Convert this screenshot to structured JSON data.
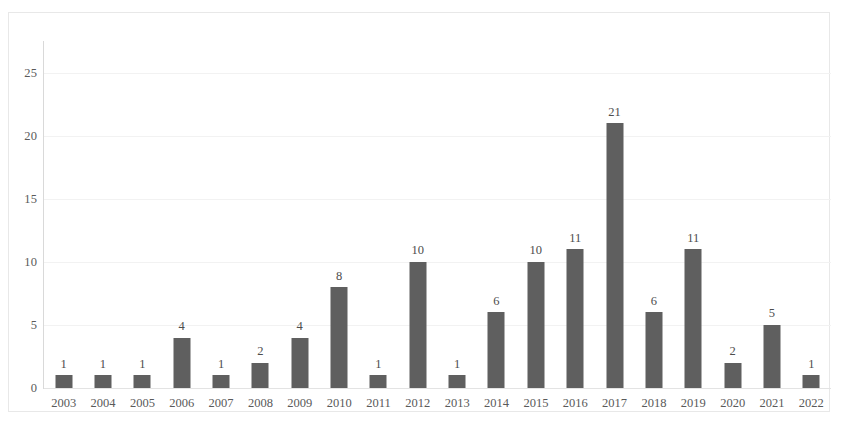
{
  "chart_data": {
    "type": "bar",
    "title": "",
    "subtitle": "",
    "xlabel": "",
    "ylabel": "",
    "categories": [
      "2003",
      "2004",
      "2005",
      "2006",
      "2007",
      "2008",
      "2009",
      "2010",
      "2011",
      "2012",
      "2013",
      "2014",
      "2015",
      "2016",
      "2017",
      "2018",
      "2019",
      "2020",
      "2021",
      "2022"
    ],
    "values": [
      1,
      1,
      1,
      4,
      1,
      2,
      4,
      8,
      1,
      10,
      1,
      6,
      10,
      11,
      21,
      6,
      11,
      2,
      5,
      1
    ],
    "data_labels": [
      "1",
      "1",
      "1",
      "4",
      "1",
      "2",
      "4",
      "8",
      "1",
      "10",
      "1",
      "6",
      "10",
      "11",
      "21",
      "6",
      "11",
      "2",
      "5",
      "1"
    ],
    "ylim": [
      0,
      27.5
    ],
    "y_ticks": [
      0,
      5,
      10,
      15,
      20,
      25
    ],
    "y_tick_labels": [
      "0",
      "5",
      "10",
      "15",
      "20",
      "25"
    ],
    "grid": true,
    "grid_axis": "y",
    "legend": false,
    "legend_position": "none",
    "bar_color": "#5f5f5f",
    "gridline_color": "#f2f2f2",
    "axis_color": "#d9d9d9",
    "label_color": "#5a5a5a",
    "border_color": "#e8e8e8",
    "background": "#ffffff",
    "series": [
      {
        "name": "Publications",
        "values": [
          1,
          1,
          1,
          4,
          1,
          2,
          4,
          8,
          1,
          10,
          1,
          6,
          10,
          11,
          21,
          6,
          11,
          2,
          5,
          1
        ]
      }
    ]
  }
}
